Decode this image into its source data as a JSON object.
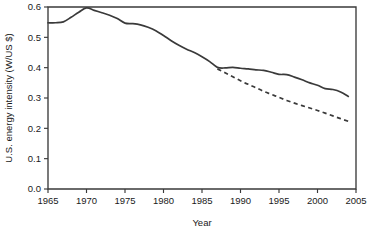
{
  "chart_data": {
    "type": "line",
    "title": "",
    "xlabel": "Year",
    "ylabel": "U.S. energy intensity (W/US $)",
    "xlim": [
      1965,
      2005
    ],
    "ylim": [
      0.0,
      0.6
    ],
    "grid": false,
    "legend": "none",
    "xticks": [
      "1965",
      "1970",
      "1975",
      "1980",
      "1985",
      "1990",
      "1995",
      "2000",
      "2005"
    ],
    "xtick_values": [
      1965,
      1970,
      1975,
      1980,
      1985,
      1990,
      1995,
      2000,
      2005
    ],
    "yticks": [
      "0.0",
      "0.1",
      "0.2",
      "0.3",
      "0.4",
      "0.5",
      "0.6"
    ],
    "ytick_values": [
      0.0,
      0.1,
      0.2,
      0.3,
      0.4,
      0.5,
      0.6
    ],
    "series": [
      {
        "name": "U.S. energy intensity (actual)",
        "style": "solid",
        "color": "#3a3a3a",
        "x": [
          1965,
          1966,
          1967,
          1968,
          1969,
          1970,
          1971,
          1972,
          1973,
          1974,
          1975,
          1976,
          1977,
          1978,
          1979,
          1980,
          1981,
          1982,
          1983,
          1984,
          1985,
          1986,
          1987,
          1988,
          1989,
          1990,
          1991,
          1992,
          1993,
          1994,
          1995,
          1996,
          1997,
          1998,
          1999,
          2000,
          2001,
          2002,
          2003,
          2004
        ],
        "values": [
          0.548,
          0.548,
          0.551,
          0.566,
          0.583,
          0.597,
          0.589,
          0.581,
          0.573,
          0.562,
          0.547,
          0.545,
          0.541,
          0.533,
          0.522,
          0.506,
          0.489,
          0.474,
          0.461,
          0.45,
          0.436,
          0.42,
          0.401,
          0.399,
          0.401,
          0.398,
          0.396,
          0.393,
          0.391,
          0.385,
          0.378,
          0.377,
          0.369,
          0.36,
          0.35,
          0.342,
          0.331,
          0.328,
          0.32,
          0.305
        ]
      },
      {
        "name": "Projected trend",
        "style": "dashed",
        "color": "#3a3a3a",
        "x": [
          1987,
          1988,
          1989,
          1990,
          1991,
          1992,
          1993,
          1994,
          1995,
          1996,
          1997,
          1998,
          1999,
          2000,
          2001,
          2002,
          2003,
          2004
        ],
        "values": [
          0.396,
          0.383,
          0.37,
          0.357,
          0.345,
          0.334,
          0.322,
          0.312,
          0.302,
          0.292,
          0.283,
          0.275,
          0.267,
          0.259,
          0.25,
          0.241,
          0.232,
          0.223
        ]
      }
    ]
  },
  "colors": {
    "line": "#3a3a3a",
    "axis": "#3a3a3a",
    "background": "#ffffff",
    "text": "#1a1a1a"
  }
}
